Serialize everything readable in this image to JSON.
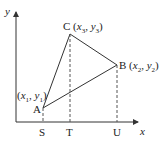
{
  "axes": {
    "x_label": "x",
    "y_label": "y"
  },
  "points": {
    "A": {
      "name": "A",
      "coords": "(x1, y1)",
      "x_sym": "x",
      "x_sub": "1",
      "y_sym": "y",
      "y_sub": "1"
    },
    "B": {
      "name": "B",
      "coords": "(x2, y2)",
      "x_sym": "x",
      "x_sub": "2",
      "y_sym": "y",
      "y_sub": "2"
    },
    "C": {
      "name": "C",
      "coords": "(x3, y3)",
      "x_sym": "x",
      "x_sub": "3",
      "y_sym": "y",
      "y_sub": "3"
    }
  },
  "x_ticks": {
    "S": "S",
    "T": "T",
    "U": "U"
  },
  "colors": {
    "line": "#333333",
    "dashed": "#555555"
  }
}
